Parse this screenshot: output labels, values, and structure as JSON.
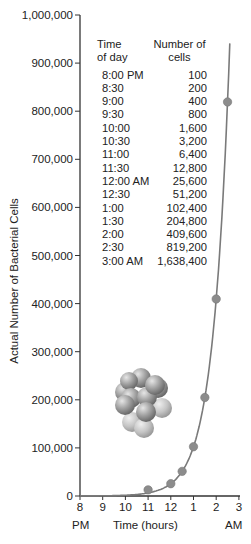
{
  "chart_data": {
    "type": "line",
    "title": "",
    "xlabel": "Time (hours)",
    "ylabel": "Actual Number of Bacterial Cells",
    "x_ticks": [
      "8",
      "9",
      "10",
      "11",
      "12",
      "1",
      "2",
      "3"
    ],
    "x_tick_sublabels": {
      "start": "PM",
      "end": "AM"
    },
    "y_ticks": [
      "0",
      "100,000",
      "200,000",
      "300,000",
      "400,000",
      "500,000",
      "600,000",
      "700,000",
      "800,000",
      "900,000",
      "1,000,000"
    ],
    "ylim": [
      0,
      1000000
    ],
    "xlim": [
      "8:00 PM",
      "3:00 AM"
    ],
    "grid": false,
    "legend": null,
    "series": [
      {
        "name": "Bacterial growth",
        "x": [
          "8:00 PM",
          "8:30",
          "9:00",
          "9:30",
          "10:00",
          "10:30",
          "11:00",
          "11:30",
          "12:00 AM",
          "12:30",
          "1:00",
          "1:30",
          "2:00",
          "2:30",
          "3:00 AM"
        ],
        "values": [
          100,
          200,
          400,
          800,
          1600,
          3200,
          6400,
          12800,
          25600,
          51200,
          102400,
          204800,
          409600,
          819200,
          1638400
        ]
      }
    ],
    "plotted_markers": [
      {
        "x": "11:00",
        "y": 12800
      },
      {
        "x": "12:00 AM",
        "y": 25600
      },
      {
        "x": "12:30",
        "y": 51200
      },
      {
        "x": "1:00",
        "y": 102400
      },
      {
        "x": "1:30",
        "y": 204800
      },
      {
        "x": "2:00",
        "y": 409600
      },
      {
        "x": "2:30",
        "y": 819200
      }
    ],
    "inset_table": {
      "headers": [
        "Time of day",
        "Number of cells"
      ],
      "rows": [
        [
          "8:00 PM",
          "100"
        ],
        [
          "8:30",
          "200"
        ],
        [
          "9:00",
          "400"
        ],
        [
          "9:30",
          "800"
        ],
        [
          "10:00",
          "1,600"
        ],
        [
          "10:30",
          "3,200"
        ],
        [
          "11:00",
          "6,400"
        ],
        [
          "11:30",
          "12,800"
        ],
        [
          "12:00 AM",
          "25,600"
        ],
        [
          "12:30",
          "51,200"
        ],
        [
          "1:00",
          "102,400"
        ],
        [
          "1:30",
          "204,800"
        ],
        [
          "2:00",
          "409,600"
        ],
        [
          "2:30",
          "819,200"
        ],
        [
          "3:00 AM",
          "1,638,400"
        ]
      ]
    },
    "annotations": [
      "illustration of a cluster of bacterial cells"
    ]
  },
  "labels": {
    "yaxis_title": "Actual Number of Bacterial Cells",
    "xaxis_title": "Time (hours)",
    "pm": "PM",
    "am": "AM",
    "table_header_time": "Time\nof day",
    "table_header_cells": "Number of\ncells"
  },
  "colors": {
    "curve": "#7a7a7a",
    "marker": "#8c8c8c",
    "axis": "#333333",
    "text": "#222222"
  }
}
